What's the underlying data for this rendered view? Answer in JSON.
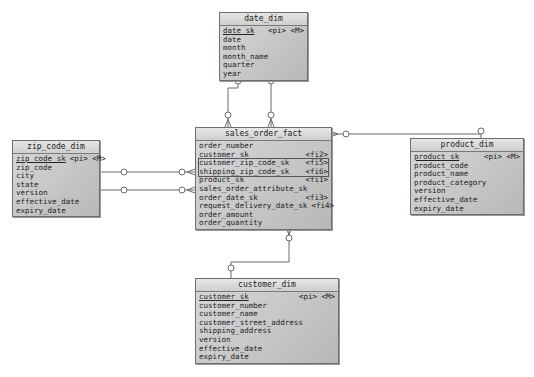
{
  "diagram": {
    "entities": {
      "date_dim": {
        "title": "date_dim",
        "attrs": [
          {
            "name": "date_sk",
            "tag": "<pi> <M>",
            "pk": true
          },
          {
            "name": "date",
            "tag": ""
          },
          {
            "name": "month",
            "tag": ""
          },
          {
            "name": "month_name",
            "tag": ""
          },
          {
            "name": "quarter",
            "tag": ""
          },
          {
            "name": "year",
            "tag": ""
          }
        ]
      },
      "sales_order_fact": {
        "title": "sales_order_fact",
        "attrs": [
          {
            "name": "order_number",
            "tag": ""
          },
          {
            "name": "customer_sk",
            "tag": "<fi2>"
          },
          {
            "name": "customer_zip_code_sk",
            "tag": "<fi5>"
          },
          {
            "name": "shipping_zip_code_sk",
            "tag": "<fi6>"
          },
          {
            "name": "product_sk",
            "tag": "<fi1>"
          },
          {
            "name": "sales_order_attribute_sk",
            "tag": ""
          },
          {
            "name": "order_date_sk",
            "tag": "<fi3>"
          },
          {
            "name": "request_delivery_date_sk",
            "tag": "<fi4>"
          },
          {
            "name": "order_amount",
            "tag": ""
          },
          {
            "name": "order_quantity",
            "tag": ""
          }
        ]
      },
      "zip_code_dim": {
        "title": "zip_code_dim",
        "attrs": [
          {
            "name": "zip_code_sk",
            "tag": "<pi> <M>",
            "pk": true
          },
          {
            "name": "zip_code",
            "tag": ""
          },
          {
            "name": "city",
            "tag": ""
          },
          {
            "name": "state",
            "tag": ""
          },
          {
            "name": "version",
            "tag": ""
          },
          {
            "name": "effective_date",
            "tag": ""
          },
          {
            "name": "expiry_date",
            "tag": ""
          }
        ]
      },
      "product_dim": {
        "title": "product_dim",
        "attrs": [
          {
            "name": "product_sk",
            "tag": "<pi> <M>",
            "pk": true
          },
          {
            "name": "product_code",
            "tag": ""
          },
          {
            "name": "product_name",
            "tag": ""
          },
          {
            "name": "product_category",
            "tag": ""
          },
          {
            "name": "version",
            "tag": ""
          },
          {
            "name": "effective_date",
            "tag": ""
          },
          {
            "name": "expiry_date",
            "tag": ""
          }
        ]
      },
      "customer_dim": {
        "title": "customer_dim",
        "attrs": [
          {
            "name": "customer_sk",
            "tag": "<pi> <M>",
            "pk": true
          },
          {
            "name": "customer_number",
            "tag": ""
          },
          {
            "name": "customer_name",
            "tag": ""
          },
          {
            "name": "customer_street_address",
            "tag": ""
          },
          {
            "name": "shipping_address",
            "tag": ""
          },
          {
            "name": "version",
            "tag": ""
          },
          {
            "name": "effective_date",
            "tag": ""
          },
          {
            "name": "expiry_date",
            "tag": ""
          }
        ]
      }
    },
    "colors": {
      "line": "#6a6a6a",
      "box_fill": "#c8c8c8",
      "highlight": "#555555"
    }
  }
}
